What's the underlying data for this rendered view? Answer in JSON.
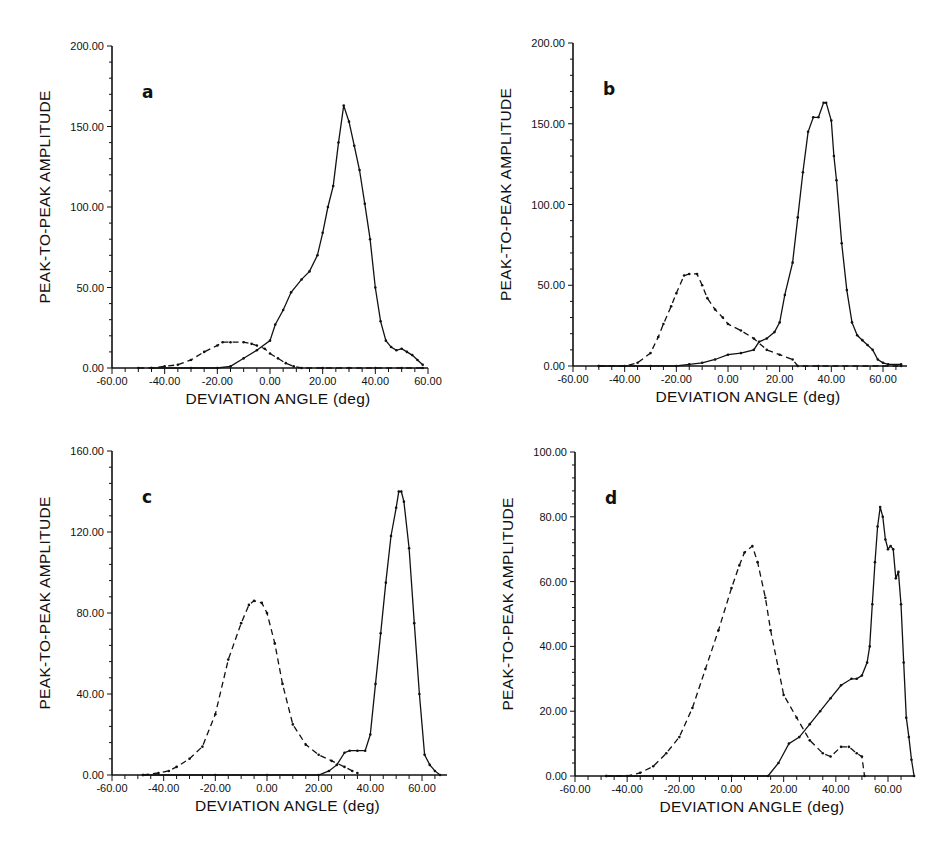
{
  "figure": {
    "panels": [
      {
        "id": "a",
        "letter": "a",
        "xlabel": "DEVIATION ANGLE (deg)",
        "ylabel": "PEAK-TO-PEAK AMPLITUDE"
      },
      {
        "id": "b",
        "letter": "b",
        "xlabel": "DEVIATION ANGLE (deg)",
        "ylabel": "PEAK-TO-PEAK AMPLITUDE"
      },
      {
        "id": "c",
        "letter": "c",
        "xlabel": "DEVIATION ANGLE (deg)",
        "ylabel": "PEAK-TO-PEAK AMPLITUDE"
      },
      {
        "id": "d",
        "letter": "d",
        "xlabel": "DEVIATION ANGLE (deg)",
        "ylabel": "PEAK-TO-PEAK AMPLITUDE"
      }
    ]
  },
  "chart_data": [
    {
      "type": "line",
      "title": "a",
      "xlabel": "DEVIATION ANGLE (deg)",
      "ylabel": "PEAK-TO-PEAK AMPLITUDE",
      "xlim": [
        -60,
        60
      ],
      "ylim": [
        0,
        200
      ],
      "xticks": [
        "-60.00",
        "-40.00",
        "-20.00",
        "0.00",
        "20.00",
        "40.00",
        "60.00"
      ],
      "yticks": [
        "0.00",
        "50.00",
        "100.00",
        "150.00",
        "200.00"
      ],
      "grid": false,
      "series": [
        {
          "name": "solid",
          "style": "solid",
          "x": [
            -45,
            -30,
            -20,
            -15,
            -10,
            -5,
            0,
            2,
            5,
            8,
            12,
            15,
            18,
            20,
            22,
            24,
            26,
            28,
            30,
            32,
            34,
            36,
            38,
            40,
            42,
            44,
            46,
            48,
            50,
            52,
            54,
            56,
            58
          ],
          "y": [
            0,
            0,
            0,
            1,
            6,
            11,
            17,
            27,
            36,
            47,
            55,
            60,
            70,
            84,
            100,
            113,
            140,
            163,
            153,
            138,
            123,
            102,
            80,
            50,
            29,
            17,
            13,
            11,
            12,
            10,
            8,
            5,
            2
          ]
        },
        {
          "name": "dashed",
          "style": "dashed",
          "x": [
            -50,
            -45,
            -40,
            -35,
            -30,
            -25,
            -20,
            -18,
            -15,
            -10,
            -7,
            -5,
            -2,
            0,
            3,
            6,
            9,
            12,
            20,
            30,
            40,
            50,
            58
          ],
          "y": [
            0,
            0,
            1,
            2,
            5,
            10,
            14,
            16,
            16,
            16,
            15,
            14,
            12,
            9,
            6,
            3,
            1,
            0,
            0,
            0,
            0,
            0,
            0
          ]
        }
      ]
    },
    {
      "type": "line",
      "title": "b",
      "xlabel": "DEVIATION ANGLE (deg)",
      "ylabel": "PEAK-TO-PEAK AMPLITUDE",
      "xlim": [
        -60,
        68
      ],
      "ylim": [
        0,
        200
      ],
      "xticks": [
        "-60.00",
        "-40.00",
        "-20.00",
        "0.00",
        "20.00",
        "40.00",
        "60.00"
      ],
      "yticks": [
        "0.00",
        "50.00",
        "100.00",
        "150.00",
        "200.00"
      ],
      "grid": false,
      "series": [
        {
          "name": "solid",
          "style": "solid",
          "x": [
            -50,
            -30,
            -20,
            -15,
            -10,
            -5,
            0,
            5,
            10,
            12,
            15,
            18,
            20,
            22,
            25,
            27,
            29,
            31,
            33,
            35,
            37,
            38,
            40,
            41,
            42,
            44,
            46,
            48,
            50,
            52,
            54,
            56,
            58,
            60,
            62,
            67
          ],
          "y": [
            0,
            0,
            0,
            1,
            2,
            4,
            7,
            8,
            10,
            15,
            17,
            21,
            27,
            44,
            64,
            92,
            120,
            145,
            154,
            154,
            163,
            163,
            152,
            130,
            115,
            76,
            47,
            27,
            19,
            16,
            13,
            10,
            4,
            2,
            1,
            1
          ]
        },
        {
          "name": "dashed",
          "style": "dashed",
          "x": [
            -50,
            -40,
            -35,
            -30,
            -27,
            -25,
            -22,
            -20,
            -17,
            -15,
            -12,
            -10,
            -8,
            -5,
            -2,
            0,
            5,
            10,
            15,
            20,
            25,
            27,
            35,
            67
          ],
          "y": [
            0,
            0,
            2,
            8,
            18,
            26,
            37,
            45,
            56,
            57,
            57,
            50,
            42,
            35,
            30,
            26,
            22,
            17,
            10,
            7,
            4,
            0,
            0,
            0
          ]
        }
      ]
    },
    {
      "type": "line",
      "title": "c",
      "xlabel": "DEVIATION ANGLE (deg)",
      "ylabel": "PEAK-TO-PEAK AMPLITUDE",
      "xlim": [
        -60,
        68
      ],
      "ylim": [
        0,
        160
      ],
      "xticks": [
        "-60.00",
        "-40.00",
        "-20.00",
        "0.00",
        "20.00",
        "40.00",
        "60.00"
      ],
      "yticks": [
        "0.00",
        "40.00",
        "80.00",
        "120.00",
        "160.00"
      ],
      "grid": false,
      "series": [
        {
          "name": "solid",
          "style": "solid",
          "x": [
            -48,
            -20,
            0,
            20,
            24,
            27,
            30,
            32,
            35,
            38,
            40,
            42,
            44,
            46,
            48,
            50,
            51,
            52,
            53,
            55,
            57,
            59,
            61,
            63,
            65,
            67
          ],
          "y": [
            0,
            0,
            0,
            0,
            2,
            5,
            11,
            12,
            12,
            12,
            20,
            45,
            70,
            95,
            118,
            132,
            140,
            140,
            135,
            112,
            75,
            40,
            10,
            5,
            2,
            0
          ]
        },
        {
          "name": "dashed",
          "style": "dashed",
          "x": [
            -48,
            -42,
            -38,
            -35,
            -30,
            -25,
            -20,
            -15,
            -10,
            -7,
            -5,
            -2,
            0,
            3,
            6,
            10,
            15,
            20,
            25,
            30,
            33,
            35
          ],
          "y": [
            0,
            1,
            2,
            4,
            8,
            14,
            30,
            57,
            75,
            84,
            86,
            85,
            80,
            65,
            45,
            25,
            15,
            10,
            7,
            4,
            2,
            1
          ]
        }
      ]
    },
    {
      "type": "line",
      "title": "d",
      "xlabel": "DEVIATION ANGLE (deg)",
      "ylabel": "PEAK-TO-PEAK AMPLITUDE",
      "xlim": [
        -60,
        70
      ],
      "ylim": [
        0,
        100
      ],
      "xticks": [
        "-60.00",
        "-40.00",
        "-20.00",
        "0.00",
        "20.00",
        "40.00",
        "60.00"
      ],
      "yticks": [
        "0.00",
        "20.00",
        "40.00",
        "60.00",
        "80.00",
        "100.00"
      ],
      "grid": false,
      "series": [
        {
          "name": "solid",
          "style": "solid",
          "x": [
            -48,
            0,
            14,
            18,
            22,
            26,
            30,
            34,
            38,
            42,
            46,
            48,
            50,
            52,
            53,
            54,
            55,
            56,
            57,
            58,
            59,
            60,
            61,
            62,
            63,
            64,
            65,
            66,
            67,
            68,
            69,
            70
          ],
          "y": [
            0,
            0,
            0,
            4,
            10,
            12,
            16,
            20,
            24,
            28,
            30,
            30,
            31,
            35,
            40,
            53,
            66,
            77,
            83,
            80,
            73,
            70,
            71,
            70,
            61,
            63,
            53,
            35,
            18,
            12,
            5,
            0
          ]
        },
        {
          "name": "dashed",
          "style": "dashed",
          "x": [
            -48,
            -40,
            -35,
            -30,
            -25,
            -20,
            -15,
            -10,
            -5,
            0,
            3,
            5,
            8,
            10,
            13,
            15,
            18,
            20,
            25,
            30,
            35,
            38,
            42,
            45,
            48,
            50,
            51
          ],
          "y": [
            0,
            0,
            1,
            3,
            7,
            12,
            21,
            33,
            45,
            58,
            65,
            69,
            71,
            66,
            55,
            45,
            33,
            25,
            18,
            11,
            7,
            6,
            9,
            9,
            7,
            6,
            0
          ]
        }
      ]
    }
  ]
}
